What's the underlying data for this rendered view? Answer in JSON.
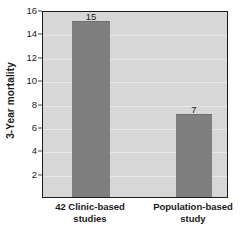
{
  "chart_data": {
    "type": "bar",
    "title": "",
    "xlabel": "",
    "ylabel": "3-Year mortality",
    "categories": [
      "42 Clinic-based studies",
      "Population-based study"
    ],
    "category_lines": [
      [
        "42 Clinic-based",
        "studies"
      ],
      [
        "Population-based",
        "study"
      ]
    ],
    "values": [
      15,
      7
    ],
    "value_labels": [
      "15",
      "7"
    ],
    "ylim": [
      0,
      16
    ],
    "yticks": [
      2,
      4,
      6,
      8,
      10,
      12,
      14,
      16
    ],
    "ytick_labels": [
      "2",
      "4",
      "6",
      "8",
      "10",
      "12",
      "14",
      "16"
    ],
    "grid": true,
    "legend": null,
    "colors": {
      "bar_fill": "#7f7f7f",
      "plot_background": "#d7d7d7",
      "gridline": "#ececec",
      "axis": "#1c1c1c",
      "text": "#1a1a1a",
      "figure_background": "#ffffff"
    }
  }
}
